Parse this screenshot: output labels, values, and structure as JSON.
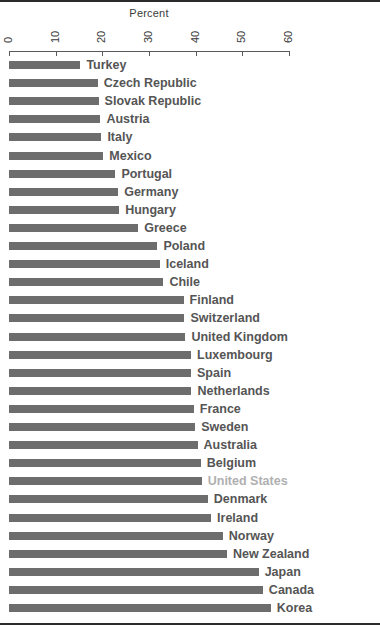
{
  "chart_data": {
    "type": "bar",
    "orientation": "horizontal",
    "title": "Percent",
    "xlabel": "Percent",
    "ylabel": "",
    "xlim": [
      0,
      60
    ],
    "xticks": [
      0,
      10,
      20,
      30,
      40,
      50,
      60
    ],
    "xtick_labels": [
      "0",
      "10",
      "20",
      "30",
      "40",
      "50",
      "60"
    ],
    "tick_label_rotation": 90,
    "grid": false,
    "legend": null,
    "bar_color": "#6d6d6d",
    "label_color": "#555555",
    "highlight_label_color": "#b0b0b0",
    "highlighted_category": "United States",
    "categories": [
      "Turkey",
      "Czech Republic",
      "Slovak Republic",
      "Austria",
      "Italy",
      "Mexico",
      "Portugal",
      "Germany",
      "Hungary",
      "Greece",
      "Poland",
      "Iceland",
      "Chile",
      "Finland",
      "Switzerland",
      "United Kingdom",
      "Luxembourg",
      "Spain",
      "Netherlands",
      "France",
      "Sweden",
      "Australia",
      "Belgium",
      "United States",
      "Denmark",
      "Ireland",
      "Norway",
      "New Zealand",
      "Japan",
      "Canada",
      "Korea"
    ],
    "values": [
      15.3,
      19.0,
      19.2,
      19.6,
      19.8,
      20.2,
      22.8,
      23.4,
      23.6,
      27.7,
      31.8,
      32.3,
      33.1,
      37.4,
      37.6,
      37.8,
      39.0,
      39.0,
      39.1,
      39.6,
      39.9,
      40.4,
      41.1,
      41.3,
      42.6,
      43.3,
      45.8,
      46.7,
      53.5,
      54.4,
      56.1
    ]
  }
}
